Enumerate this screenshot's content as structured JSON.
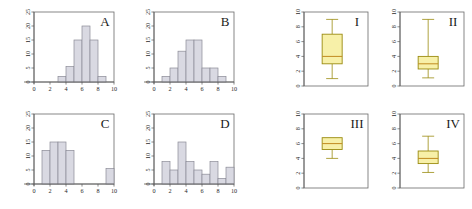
{
  "figure": {
    "background_color": "#ffffff",
    "hist_bar_fill": "#d9d9e2",
    "hist_bar_stroke": "#8b8b96",
    "box_fill": "#f7f0a8",
    "box_stroke": "#9a8b10",
    "box_median_color": "#c08a20",
    "axis_color": "#5a5a5a",
    "frame_color": "#6a6a6a"
  },
  "chart_data": [
    {
      "type": "bar",
      "title": "A",
      "panel_id": "hist-a",
      "xlabel": "",
      "ylabel": "",
      "xlim": [
        0,
        10
      ],
      "ylim": [
        0,
        25
      ],
      "xticks": [
        0,
        2,
        4,
        6,
        8,
        10
      ],
      "yticks": [
        0,
        5,
        10,
        15,
        20,
        25
      ],
      "grid": false,
      "bin_edges": [
        3,
        4,
        5,
        6,
        7,
        8,
        9
      ],
      "values": [
        2,
        5.5,
        15,
        20,
        15,
        2
      ],
      "categories": [
        "3-4",
        "4-5",
        "5-6",
        "6-7",
        "7-8",
        "8-9"
      ]
    },
    {
      "type": "bar",
      "title": "B",
      "panel_id": "hist-b",
      "xlabel": "",
      "ylabel": "",
      "xlim": [
        0,
        10
      ],
      "ylim": [
        0,
        25
      ],
      "xticks": [
        0,
        2,
        4,
        6,
        8,
        10
      ],
      "yticks": [
        0,
        5,
        10,
        15,
        20,
        25
      ],
      "grid": false,
      "bin_edges": [
        1,
        2,
        3,
        4,
        5,
        6,
        7,
        8,
        9
      ],
      "values": [
        2,
        5,
        11,
        15,
        15,
        5,
        5,
        2
      ],
      "categories": [
        "1-2",
        "2-3",
        "3-4",
        "4-5",
        "5-6",
        "6-7",
        "7-8",
        "8-9"
      ]
    },
    {
      "type": "bar",
      "title": "C",
      "panel_id": "hist-c",
      "xlabel": "",
      "ylabel": "",
      "xlim": [
        0,
        10
      ],
      "ylim": [
        0,
        25
      ],
      "xticks": [
        0,
        2,
        4,
        6,
        8,
        10
      ],
      "yticks": [
        0,
        5,
        10,
        15,
        20,
        25
      ],
      "grid": false,
      "bin_edges": [
        1,
        2,
        3,
        4,
        5,
        9,
        10
      ],
      "values": [
        12,
        15,
        15,
        12,
        0,
        5.5
      ],
      "categories": [
        "1-2",
        "2-3",
        "3-4",
        "4-5",
        "5-9",
        "9-10"
      ]
    },
    {
      "type": "bar",
      "title": "D",
      "panel_id": "hist-d",
      "xlabel": "",
      "ylabel": "",
      "xlim": [
        0,
        10
      ],
      "ylim": [
        0,
        25
      ],
      "xticks": [
        0,
        2,
        4,
        6,
        8,
        10
      ],
      "yticks": [
        0,
        5,
        10,
        15,
        20,
        25
      ],
      "grid": false,
      "bin_edges": [
        1,
        2,
        3,
        4,
        5,
        6,
        7,
        8,
        9,
        10
      ],
      "values": [
        8,
        5,
        15,
        8,
        5,
        3.5,
        8,
        2,
        6
      ],
      "categories": [
        "1-2",
        "2-3",
        "3-4",
        "4-5",
        "5-6",
        "6-7",
        "7-8",
        "8-9",
        "9-10"
      ]
    },
    {
      "type": "boxplot",
      "title": "I",
      "panel_id": "box-i",
      "xlabel": "",
      "ylabel": "",
      "ylim": [
        0,
        10
      ],
      "yticks": [
        0,
        2,
        4,
        6,
        8,
        10
      ],
      "grid": false,
      "stats": {
        "min": 1.0,
        "q1": 3.0,
        "median": 4.0,
        "q3": 7.0,
        "max": 9.0
      }
    },
    {
      "type": "boxplot",
      "title": "II",
      "panel_id": "box-ii",
      "xlabel": "",
      "ylabel": "",
      "ylim": [
        0,
        10
      ],
      "yticks": [
        0,
        2,
        4,
        6,
        8,
        10
      ],
      "grid": false,
      "stats": {
        "min": 1.1,
        "q1": 2.3,
        "median": 3.0,
        "q3": 4.0,
        "max": 9.0
      }
    },
    {
      "type": "boxplot",
      "title": "III",
      "panel_id": "box-iii",
      "xlabel": "",
      "ylabel": "",
      "ylim": [
        0,
        10
      ],
      "yticks": [
        0,
        2,
        4,
        6,
        8,
        10
      ],
      "grid": false,
      "stats": {
        "min": 4.0,
        "q1": 5.2,
        "median": 6.0,
        "q3": 6.8,
        "max": 6.8
      }
    },
    {
      "type": "boxplot",
      "title": "IV",
      "panel_id": "box-iv",
      "xlabel": "",
      "ylabel": "",
      "ylim": [
        0,
        10
      ],
      "yticks": [
        0,
        2,
        4,
        6,
        8,
        10
      ],
      "grid": false,
      "stats": {
        "min": 2.1,
        "q1": 3.3,
        "median": 4.0,
        "q3": 5.0,
        "max": 7.0
      }
    }
  ],
  "panels": {
    "a": {
      "label": "A"
    },
    "b": {
      "label": "B"
    },
    "c": {
      "label": "C"
    },
    "d": {
      "label": "D"
    },
    "i": {
      "label": "I"
    },
    "ii": {
      "label": "II"
    },
    "iii": {
      "label": "III"
    },
    "iv": {
      "label": "IV"
    }
  }
}
